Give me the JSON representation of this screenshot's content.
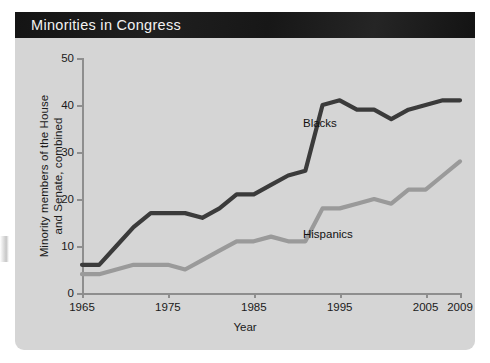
{
  "figure": {
    "title": "Minorities in Congress",
    "title_bar_color": "#1b1b1b",
    "panel_color": "#d5d5d5"
  },
  "chart_data": {
    "type": "line",
    "title": "Minorities in Congress",
    "xlabel": "Year",
    "ylabel": "Minority members of the House and Senate, combined",
    "xlim": [
      1965,
      2009
    ],
    "ylim": [
      0,
      50
    ],
    "grid": false,
    "legend_position": "inline-annotation",
    "xticks": [
      1965,
      1975,
      1985,
      1995,
      2005,
      2009
    ],
    "yticks": [
      0,
      10,
      20,
      30,
      40,
      50
    ],
    "x": [
      1965,
      1967,
      1969,
      1971,
      1973,
      1975,
      1977,
      1979,
      1981,
      1983,
      1985,
      1987,
      1989,
      1991,
      1993,
      1995,
      1997,
      1999,
      2001,
      2003,
      2005,
      2007,
      2009
    ],
    "series": [
      {
        "name": "Blacks",
        "color": "#3b3b3b",
        "values": [
          6,
          6,
          10,
          14,
          17,
          17,
          17,
          16,
          18,
          21,
          21,
          23,
          25,
          26,
          40,
          41,
          39,
          39,
          37,
          39,
          40,
          41,
          41
        ]
      },
      {
        "name": "Hispanics",
        "color": "#9a9a9a",
        "values": [
          4,
          4,
          5,
          6,
          6,
          6,
          5,
          7,
          9,
          11,
          11,
          12,
          11,
          11,
          18,
          18,
          19,
          20,
          19,
          22,
          22,
          25,
          28
        ]
      }
    ]
  },
  "axis": {
    "y_title_line1": "Minority members of the House",
    "y_title_line2": "and Senate, combined",
    "x_title": "Year"
  }
}
